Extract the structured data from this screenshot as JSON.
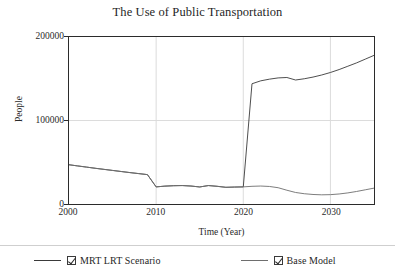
{
  "chart_data": {
    "type": "line",
    "title": "The Use of Public Transportation",
    "xlabel": "Time (Year)",
    "ylabel": "People",
    "xlim": [
      2000,
      2035
    ],
    "ylim": [
      0,
      200000
    ],
    "xticks": [
      "2000",
      "2010",
      "2020",
      "2030"
    ],
    "yticks": [
      "0",
      "100000",
      "200000"
    ],
    "grid": true,
    "legend_position": "bottom",
    "x": [
      2000,
      2001,
      2002,
      2003,
      2004,
      2005,
      2006,
      2007,
      2008,
      2009,
      2010,
      2011,
      2012,
      2013,
      2014,
      2015,
      2016,
      2017,
      2018,
      2019,
      2020,
      2021,
      2022,
      2023,
      2024,
      2025,
      2026,
      2027,
      2028,
      2029,
      2030,
      2031,
      2032,
      2033,
      2034,
      2035
    ],
    "series": [
      {
        "name": "MRT LRT Scenario",
        "color": "#3a3a3a",
        "checked": true,
        "values": [
          47000,
          45600,
          44200,
          42800,
          41500,
          40200,
          38900,
          37600,
          36400,
          35200,
          20500,
          21400,
          21900,
          22100,
          21500,
          20400,
          22100,
          21200,
          20000,
          20300,
          20500,
          144000,
          147500,
          149500,
          151000,
          151500,
          148500,
          150000,
          152000,
          154500,
          157500,
          161000,
          165000,
          169000,
          173500,
          178000
        ]
      },
      {
        "name": "Base Model",
        "color": "#6e6e6e",
        "checked": true,
        "values": [
          47000,
          45600,
          44200,
          42800,
          41500,
          40200,
          38900,
          37600,
          36400,
          35200,
          20500,
          21400,
          21900,
          22100,
          21500,
          20400,
          22100,
          21200,
          20000,
          20300,
          20500,
          21200,
          21500,
          21000,
          19500,
          16500,
          13800,
          12300,
          11400,
          11000,
          11200,
          12000,
          13300,
          15000,
          17000,
          19000
        ]
      }
    ]
  },
  "legend": {
    "entries": [
      {
        "label": "MRT LRT Scenario"
      },
      {
        "label": "Base Model"
      }
    ]
  },
  "axes": {
    "y": {
      "t200000": "200000",
      "t100000": "100000",
      "t0": "0",
      "title": "People"
    },
    "x": {
      "t2000": "2000",
      "t2010": "2010",
      "t2020": "2020",
      "t2030": "2030",
      "title": "Time (Year)"
    }
  },
  "title": "The Use of Public Transportation"
}
